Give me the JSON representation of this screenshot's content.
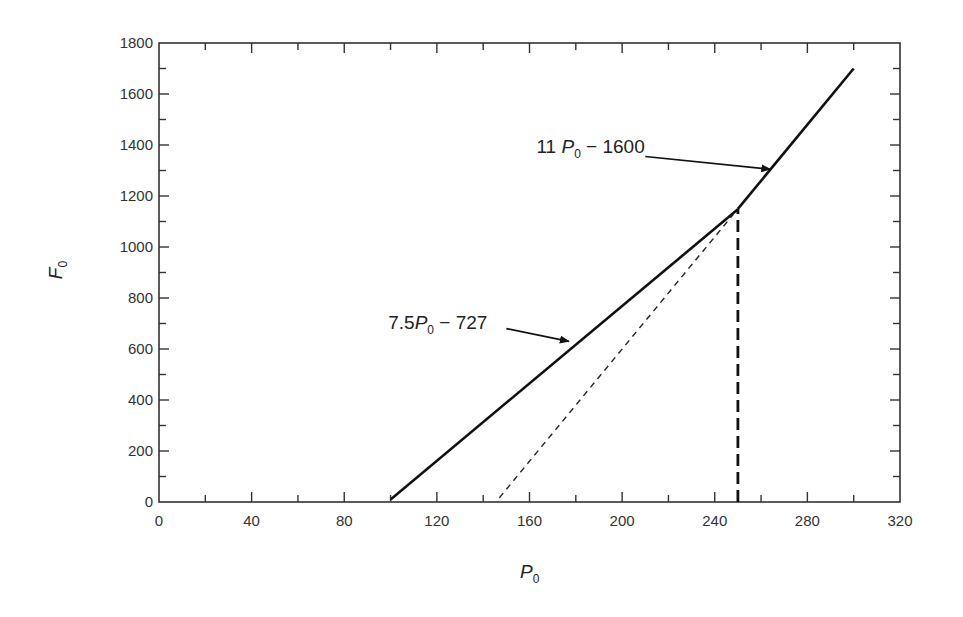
{
  "chart_data": {
    "type": "line",
    "title": "",
    "xlabel": {
      "main": "P",
      "sub": "0"
    },
    "ylabel": {
      "main": "F",
      "sub": "0"
    },
    "xlim": [
      0,
      320
    ],
    "ylim": [
      0,
      1800
    ],
    "grid": false,
    "x_ticks_major": [
      0,
      40,
      80,
      120,
      160,
      200,
      240,
      280,
      320
    ],
    "x_ticks_minor": [
      20,
      60,
      100,
      140,
      180,
      220,
      260,
      300
    ],
    "y_ticks_major": [
      0,
      200,
      400,
      600,
      800,
      1000,
      1200,
      1400,
      1600,
      1800
    ],
    "y_ticks_minor": [
      100,
      300,
      500,
      700,
      900,
      1100,
      1300,
      1500,
      1700
    ],
    "x_tick_labels": [
      "0",
      "40",
      "80",
      "120",
      "160",
      "200",
      "240",
      "280",
      "320"
    ],
    "y_tick_labels": [
      "0",
      "200",
      "400",
      "600",
      "800",
      "1000",
      "1200",
      "1400",
      "1600",
      "1800"
    ],
    "series": [
      {
        "name": "7.5 P0 - 727",
        "style": "solid",
        "points": [
          [
            100,
            10
          ],
          [
            250,
            1148
          ]
        ]
      },
      {
        "name": "11 P0 - 1600",
        "style": "solid",
        "points": [
          [
            250,
            1150
          ],
          [
            300,
            1700
          ]
        ]
      },
      {
        "name": "11 P0 - 1600 extension",
        "style": "dashed-thin",
        "points": [
          [
            147,
            17
          ],
          [
            248,
            1128
          ]
        ]
      },
      {
        "name": "P0 = 250 marker",
        "style": "dashed-thick",
        "points": [
          [
            250,
            0
          ],
          [
            250,
            1150
          ]
        ]
      }
    ],
    "annotations": [
      {
        "id": "upper",
        "parts": {
          "coef": "11 ",
          "var": "P",
          "sub": "0",
          "rest": " − 1600"
        },
        "text_at": [
          163,
          1370
        ],
        "arrow_from": [
          210,
          1355
        ],
        "arrow_to": [
          264,
          1305
        ]
      },
      {
        "id": "lower",
        "parts": {
          "coef": "7.5",
          "var": "P",
          "sub": "0",
          "rest": " − 727"
        },
        "text_at": [
          99,
          680
        ],
        "arrow_from": [
          150,
          680
        ],
        "arrow_to": [
          177,
          630
        ]
      }
    ]
  }
}
